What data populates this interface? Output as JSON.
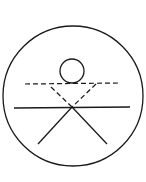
{
  "diagram": {
    "title": "",
    "stroke_color": "#1a1a1a",
    "background": "#ffffff",
    "elements": [
      {
        "id": "outer-circle",
        "type": "circle",
        "cx": 73,
        "cy": 96,
        "r": 70,
        "style": "solid"
      },
      {
        "id": "head-circle",
        "type": "circle",
        "cx": 72,
        "cy": 71,
        "r": 12,
        "style": "solid"
      },
      {
        "id": "dashed-horizontal",
        "type": "line",
        "x1": 25,
        "y1": 84,
        "x2": 119,
        "y2": 83,
        "style": "dashed"
      },
      {
        "id": "dashed-left-arm",
        "type": "line",
        "x1": 51,
        "y1": 87,
        "x2": 72,
        "y2": 107,
        "style": "dashed"
      },
      {
        "id": "dashed-right-arm",
        "type": "line",
        "x1": 96,
        "y1": 84,
        "x2": 72,
        "y2": 107,
        "style": "dashed"
      },
      {
        "id": "solid-horizontal",
        "type": "line",
        "x1": 14,
        "y1": 108,
        "x2": 130,
        "y2": 107,
        "style": "solid"
      },
      {
        "id": "left-leg",
        "type": "line",
        "x1": 72,
        "y1": 107,
        "x2": 38,
        "y2": 144,
        "style": "solid"
      },
      {
        "id": "right-leg",
        "type": "line",
        "x1": 72,
        "y1": 107,
        "x2": 107,
        "y2": 144,
        "style": "solid"
      }
    ]
  }
}
